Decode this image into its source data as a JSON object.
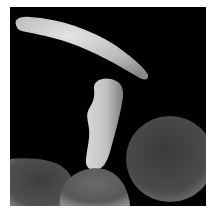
{
  "image": {
    "subject": "scanning electron micrograph of red blood cells",
    "description": "Sickle-shaped red blood cell, an elongated deformed cell, and normal disc-shaped red blood cells on a black background",
    "elements": [
      {
        "name": "sickle-cell",
        "shape": "crescent"
      },
      {
        "name": "elongated-cell",
        "shape": "bent cylinder"
      },
      {
        "name": "normal-cell-right",
        "shape": "disc"
      },
      {
        "name": "normal-cell-bottom-center",
        "shape": "disc"
      },
      {
        "name": "normal-cell-bottom-left",
        "shape": "disc"
      }
    ],
    "colors": {
      "background": "#000000",
      "frame_border": "#ffffff",
      "sickle_cell": "#cfcfcf",
      "elongated_cell": "#c8c8c8",
      "normal_cell": "#4a4a4a"
    }
  }
}
